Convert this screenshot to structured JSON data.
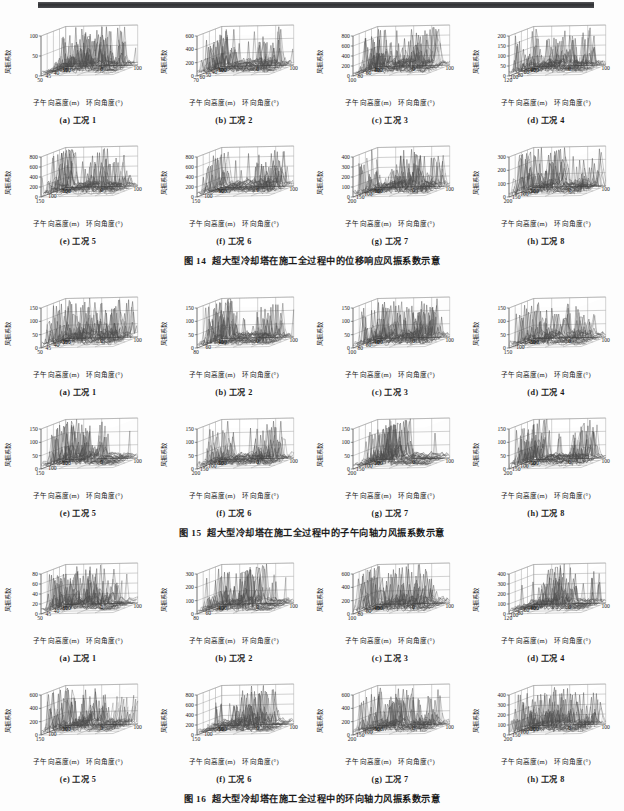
{
  "page": {
    "axis_labels": {
      "z": "风振系数",
      "x": "子午向高度(m)",
      "y": "环向角度(°)"
    },
    "subplot_labels": [
      "(a) 工况 1",
      "(b) 工况 2",
      "(c) 工况 3",
      "(d) 工况 4",
      "(e) 工况 5",
      "(f) 工况 6",
      "(g) 工况 7",
      "(h) 工况 8"
    ]
  },
  "figures": [
    {
      "number": "图 14",
      "title": "超大型冷却塔在施工全过程中的位移响应风振系数示意",
      "panels": [
        {
          "label": "(a) 工况 1",
          "zticks": [
            "100",
            "50",
            "0"
          ],
          "zmax": 100,
          "xticks": [
            "50",
            "45",
            "40",
            "35"
          ],
          "yticks": [
            "-100",
            "0",
            "100"
          ]
        },
        {
          "label": "(b) 工况 2",
          "zticks": [
            "600",
            "400",
            "200",
            "0"
          ],
          "zmax": 600,
          "xticks": [
            "70",
            "60",
            "50",
            "40",
            "30"
          ],
          "yticks": [
            "-100",
            "0",
            "100"
          ]
        },
        {
          "label": "(c) 工况 3",
          "zticks": [
            "800",
            "600",
            "400",
            "200",
            "0"
          ],
          "zmax": 800,
          "xticks": [
            "100",
            "80",
            "60",
            "40"
          ],
          "yticks": [
            "-100",
            "0",
            "100"
          ]
        },
        {
          "label": "(d) 工况 4",
          "zticks": [
            "200",
            "150",
            "100",
            "50",
            "0"
          ],
          "zmax": 200,
          "xticks": [
            "120",
            "100",
            "80",
            "60",
            "40"
          ],
          "yticks": [
            "-100",
            "0",
            "100"
          ]
        },
        {
          "label": "(e) 工况 5",
          "zticks": [
            "800",
            "600",
            "400",
            "200",
            "0"
          ],
          "zmax": 800,
          "xticks": [
            "150",
            "100",
            "50"
          ],
          "yticks": [
            "-100",
            "0",
            "100"
          ]
        },
        {
          "label": "(f) 工况 6",
          "zticks": [
            "800",
            "600",
            "400",
            "200",
            "0"
          ],
          "zmax": 800,
          "xticks": [
            "150",
            "100",
            "50"
          ],
          "yticks": [
            "-100",
            "0",
            "100"
          ]
        },
        {
          "label": "(g) 工况 7",
          "zticks": [
            "400",
            "300",
            "200",
            "100",
            "0"
          ],
          "zmax": 400,
          "xticks": [
            "200",
            "150",
            "100",
            "50"
          ],
          "yticks": [
            "-100",
            "0",
            "100"
          ]
        },
        {
          "label": "(h) 工况 8",
          "zticks": [
            "300",
            "200",
            "100",
            "0"
          ],
          "zmax": 300,
          "xticks": [
            "200",
            "150",
            "100",
            "50"
          ],
          "yticks": [
            "-100",
            "0",
            "100"
          ]
        }
      ]
    },
    {
      "number": "图 15",
      "title": "超大型冷却塔在施工全过程中的子午向轴力风振系数示意",
      "panels": [
        {
          "label": "(a) 工况 1",
          "zticks": [
            "150",
            "100",
            "50",
            "0"
          ],
          "zmax": 150,
          "xticks": [
            "50",
            "45",
            "40",
            "35"
          ],
          "yticks": [
            "-100",
            "0",
            "100"
          ]
        },
        {
          "label": "(b) 工况 2",
          "zticks": [
            "150",
            "100",
            "50",
            "0"
          ],
          "zmax": 150,
          "xticks": [
            "80",
            "60",
            "40"
          ],
          "yticks": [
            "-100",
            "0",
            "100"
          ]
        },
        {
          "label": "(c) 工况 3",
          "zticks": [
            "150",
            "100",
            "50",
            "0"
          ],
          "zmax": 150,
          "xticks": [
            "100",
            "80",
            "60",
            "40"
          ],
          "yticks": [
            "-100",
            "0",
            "100"
          ]
        },
        {
          "label": "(d) 工况 4",
          "zticks": [
            "150",
            "100",
            "50",
            "0"
          ],
          "zmax": 150,
          "xticks": [
            "150",
            "100",
            "50"
          ],
          "yticks": [
            "-100",
            "0",
            "100"
          ]
        },
        {
          "label": "(e) 工况 5",
          "zticks": [
            "150",
            "100",
            "50",
            "0"
          ],
          "zmax": 150,
          "xticks": [
            "150",
            "100",
            "50"
          ],
          "yticks": [
            "-100",
            "0",
            "100"
          ]
        },
        {
          "label": "(f) 工况 6",
          "zticks": [
            "150",
            "100",
            "50",
            "0"
          ],
          "zmax": 150,
          "xticks": [
            "200",
            "150",
            "100",
            "50"
          ],
          "yticks": [
            "-100",
            "0",
            "100"
          ]
        },
        {
          "label": "(g) 工况 7",
          "zticks": [
            "150",
            "100",
            "50",
            "0"
          ],
          "zmax": 150,
          "xticks": [
            "200",
            "150",
            "100",
            "50"
          ],
          "yticks": [
            "-100",
            "0",
            "100"
          ]
        },
        {
          "label": "(h) 工况 8",
          "zticks": [
            "150",
            "100",
            "50",
            "0"
          ],
          "zmax": 150,
          "xticks": [
            "200",
            "150",
            "100",
            "50"
          ],
          "yticks": [
            "-100",
            "0",
            "100"
          ]
        }
      ]
    },
    {
      "number": "图 16",
      "title": "超大型冷却塔在施工全过程中的环向轴力风振系数示意",
      "panels": [
        {
          "label": "(a) 工况 1",
          "zticks": [
            "80",
            "60",
            "40",
            "20",
            "0"
          ],
          "zmax": 80,
          "xticks": [
            "50",
            "45",
            "40",
            "35"
          ],
          "yticks": [
            "-100",
            "0",
            "100"
          ]
        },
        {
          "label": "(b) 工况 2",
          "zticks": [
            "300",
            "200",
            "100",
            "0"
          ],
          "zmax": 300,
          "xticks": [
            "80",
            "60",
            "40"
          ],
          "yticks": [
            "-100",
            "0",
            "100"
          ]
        },
        {
          "label": "(c) 工况 3",
          "zticks": [
            "600",
            "400",
            "200",
            "0"
          ],
          "zmax": 600,
          "xticks": [
            "100",
            "80",
            "60",
            "40"
          ],
          "yticks": [
            "-100",
            "0",
            "100"
          ]
        },
        {
          "label": "(d) 工况 4",
          "zticks": [
            "400",
            "300",
            "200",
            "100",
            "0"
          ],
          "zmax": 400,
          "xticks": [
            "120",
            "100",
            "80",
            "60",
            "40"
          ],
          "yticks": [
            "-100",
            "0",
            "100"
          ]
        },
        {
          "label": "(e) 工况 5",
          "zticks": [
            "600",
            "400",
            "200",
            "0"
          ],
          "zmax": 600,
          "xticks": [
            "150",
            "100",
            "50"
          ],
          "yticks": [
            "-100",
            "0",
            "100"
          ]
        },
        {
          "label": "(f) 工况 6",
          "zticks": [
            "800",
            "600",
            "400",
            "200",
            "0"
          ],
          "zmax": 800,
          "xticks": [
            "150",
            "100",
            "50"
          ],
          "yticks": [
            "-100",
            "0",
            "100"
          ]
        },
        {
          "label": "(g) 工况 7",
          "zticks": [
            "600",
            "400",
            "200",
            "0"
          ],
          "zmax": 600,
          "xticks": [
            "200",
            "150",
            "100",
            "50"
          ],
          "yticks": [
            "-100",
            "0",
            "100"
          ]
        },
        {
          "label": "(h) 工况 8",
          "zticks": [
            "400",
            "300",
            "200",
            "100",
            "0"
          ],
          "zmax": 400,
          "xticks": [
            "200",
            "150",
            "100",
            "50"
          ],
          "yticks": [
            "-100",
            "0",
            "100"
          ]
        }
      ]
    }
  ],
  "chart_data": {
    "type": "line",
    "xlabel": "子午向高度(m)",
    "ylabel": "环向角度(°)",
    "zlabel": "风振系数",
    "grid": true,
    "legend": "none",
    "series_count": 24
  }
}
